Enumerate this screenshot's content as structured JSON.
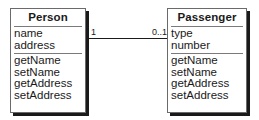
{
  "diagram": {
    "type": "uml-class-diagram",
    "classes": [
      {
        "name": "Person",
        "attributes": [
          "name",
          "address"
        ],
        "operations": [
          "getName",
          "setName",
          "getAddress",
          "setAddress"
        ]
      },
      {
        "name": "Passenger",
        "attributes": [
          "type",
          "number"
        ],
        "operations": [
          "getName",
          "setName",
          "getAddress",
          "setAddress"
        ]
      }
    ],
    "association": {
      "from": "Person",
      "to": "Passenger",
      "from_multiplicity": "1",
      "to_multiplicity": "0..1"
    }
  },
  "colors": {
    "line": "#1a1a1a",
    "border": "#6a6a6a",
    "background": "#ffffff"
  }
}
